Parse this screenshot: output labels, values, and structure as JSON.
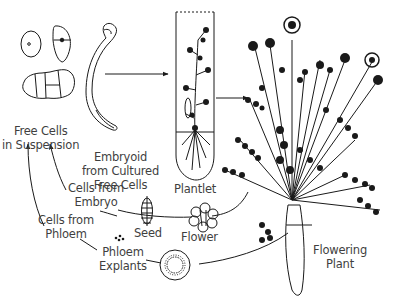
{
  "diagram": {
    "type": "cycle-illustration",
    "colors": {
      "ink": "#1a1a1a",
      "label": "#3f3f3f",
      "background": "#ffffff"
    },
    "labels": {
      "free_cells": {
        "line1": "Free Cells",
        "line2": "in Suspension"
      },
      "embryoid": {
        "line1": "Embryoid",
        "line2": "from Cultured",
        "line3": "Free Cells"
      },
      "plantlet": "Plantlet",
      "flowering_plant": {
        "line1": "Flowering",
        "line2": "Plant"
      },
      "cells_from_embryo": {
        "line1": "Cells from",
        "line2": "Embryo"
      },
      "cells_from_phloem": {
        "line1": "Cells from",
        "line2": "Phloem"
      },
      "seed": "Seed",
      "flower": "Flower",
      "phloem_explants": {
        "line1": "Phloem",
        "line2": "Explants"
      }
    },
    "nodes": [
      "free-cells-in-suspension",
      "embryoid-from-cultured-free-cells",
      "plantlet",
      "flowering-plant",
      "flower",
      "seed",
      "cells-from-embryo",
      "phloem-explants",
      "cells-from-phloem"
    ],
    "edges": [
      {
        "from": "embryoid-from-cultured-free-cells",
        "to": "plantlet"
      },
      {
        "from": "plantlet",
        "to": "flowering-plant"
      },
      {
        "from": "flowering-plant",
        "to": "flower"
      },
      {
        "from": "flowering-plant",
        "to": "phloem-explants"
      },
      {
        "from": "cells-from-embryo",
        "to": "free-cells-in-suspension"
      },
      {
        "from": "cells-from-phloem",
        "to": "free-cells-in-suspension"
      }
    ]
  }
}
